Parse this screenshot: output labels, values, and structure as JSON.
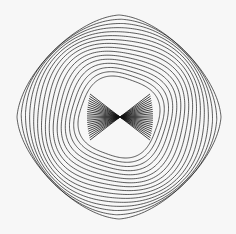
{
  "figure": {
    "background": "#f7f7f7",
    "stroke": "#1a1a1a",
    "center": [
      119,
      117
    ],
    "outer_half_extent": 102,
    "curve_count": 16,
    "bowtie": {
      "center": [
        120,
        117
      ],
      "half_width": 33,
      "half_height": 23,
      "ray_count": 22
    }
  }
}
